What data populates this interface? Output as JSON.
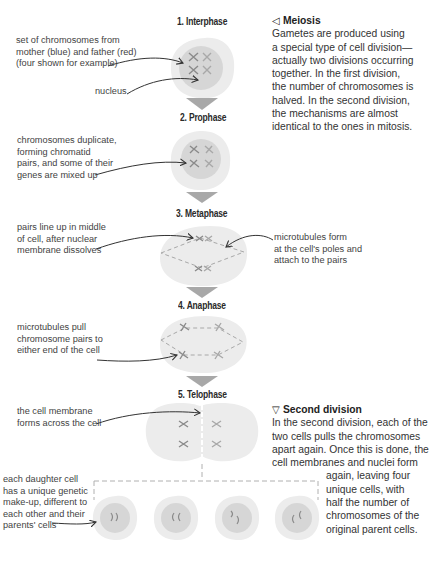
{
  "phases": [
    {
      "title": "1. Interphase"
    },
    {
      "title": "2. Prophase"
    },
    {
      "title": "3. Metaphase"
    },
    {
      "title": "4. Anaphase"
    },
    {
      "title": "5. Telophase"
    }
  ],
  "annotations": {
    "chromosomes_set": [
      "set of chromosomes from",
      "mother (blue) and father (red)",
      "(four shown for example)"
    ],
    "nucleus": [
      "nucleus"
    ],
    "prophase": [
      "chromosomes duplicate,",
      "forming chromatid",
      "pairs, and some of their",
      "genes are mixed up"
    ],
    "metaphase_left": [
      "pairs line up in middle",
      "of cell, after nuclear",
      "membrane dissolves"
    ],
    "metaphase_right": [
      "microtubules form",
      "at the cell's poles and",
      "attach to the pairs"
    ],
    "anaphase": [
      "microtubules pull",
      "chromosome pairs to",
      "either end of the cell"
    ],
    "telophase": [
      "the cell membrane",
      "forms across the cell"
    ],
    "daughter": [
      "each daughter cell",
      "has a unique genetic",
      "make-up, different to",
      "each other and their",
      "parents' cells"
    ]
  },
  "meiosis": {
    "icon": "triangle-left-icon",
    "heading": "Meiosis",
    "lines": [
      "Gametes are produced using",
      "a special type of cell division—",
      "actually two divisions occurring",
      "together. In the first division,",
      "the number of chromosomes is",
      "halved. In the second division,",
      "the mechanisms are almost",
      "identical to the ones in mitosis."
    ]
  },
  "second_division": {
    "icon": "triangle-down-icon",
    "heading": "Second division",
    "lines": [
      "In the second division, each of the",
      "two cells pulls the chromosomes",
      "apart again. Once this is done, the",
      "cell membranes and nuclei form"
    ],
    "lines_indented": [
      "again, leaving four",
      "unique cells, with",
      "half the number of",
      "chromosomes of the",
      "original parent cells."
    ]
  },
  "colors": {
    "cell_outer": "#ececec",
    "nucleus": "#d6d6d6",
    "chromosome": "#8a8a8a",
    "arrow_down": "#a8a8a8",
    "dashed": "#b0b0b0"
  }
}
